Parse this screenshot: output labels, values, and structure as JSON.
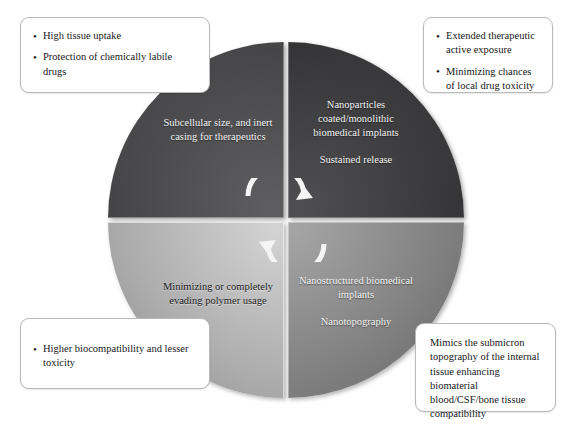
{
  "diagram": {
    "type": "four-quadrant-cycle",
    "center_icon": "circular-cycle-arrows",
    "quadrants": [
      {
        "id": "top-left",
        "position": "top-left",
        "color": "#4e4e50",
        "text_color": "#f2f2f2",
        "main": "Subcellular size, and inert casing for therapeutics",
        "sub": ""
      },
      {
        "id": "top-right",
        "position": "top-right",
        "color": "#3d3d3f",
        "text_color": "#f2f2f2",
        "main": "Nanoparticles coated/monolithic biomedical implants",
        "sub": "Sustained release"
      },
      {
        "id": "bottom-left",
        "position": "bottom-left",
        "color": "#b5b5b5",
        "text_color": "#1b1b1b",
        "main": "Minimizing or completely evading polymer usage",
        "sub": ""
      },
      {
        "id": "bottom-right",
        "position": "bottom-right",
        "color": "#8a8a8a",
        "text_color": "#f2f2f2",
        "main": "Nanostructured biomedical implants",
        "sub": "Nanotopography"
      }
    ],
    "callouts": [
      {
        "id": "top-left",
        "style": "bulleted",
        "items": [
          "High tissue uptake",
          "Protection of chemically labile drugs"
        ]
      },
      {
        "id": "top-right",
        "style": "bulleted",
        "items": [
          "Extended therapeutic active exposure",
          "Minimizing chances of local drug toxicity"
        ]
      },
      {
        "id": "bottom-left",
        "style": "bulleted",
        "items": [
          "Higher biocompatibility and lesser toxicity"
        ]
      },
      {
        "id": "bottom-right",
        "style": "plain",
        "text": "Mimics the submicron topography of the internal tissue enhancing biomaterial blood/CSF/bone tissue compatibility"
      }
    ]
  }
}
